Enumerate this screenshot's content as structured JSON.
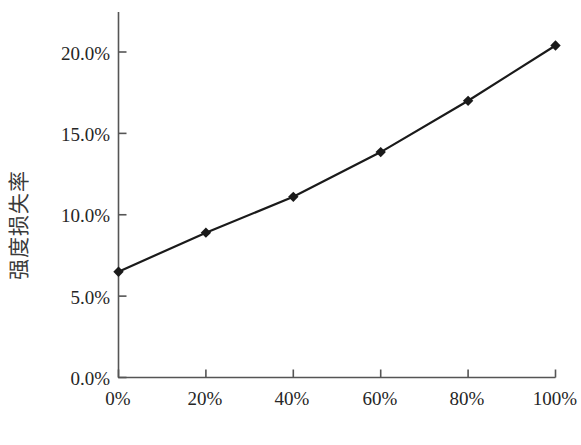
{
  "chart_data": {
    "type": "line",
    "title": "",
    "xlabel": "再生骨料替代率",
    "ylabel": "强度损失率",
    "x": [
      0,
      20,
      40,
      60,
      80,
      100
    ],
    "categories": [
      "0%",
      "20%",
      "40%",
      "60%",
      "80%",
      "100%"
    ],
    "values": [
      6.5,
      8.9,
      11.1,
      13.85,
      17.0,
      20.4
    ],
    "series": [
      {
        "name": "强度损失率",
        "values": [
          6.5,
          8.9,
          11.1,
          13.85,
          17.0,
          20.4
        ]
      }
    ],
    "xlim": [
      0,
      100
    ],
    "ylim": [
      0,
      22
    ],
    "xticks": [
      0,
      20,
      40,
      60,
      80,
      100
    ],
    "xtick_labels": [
      "0%",
      "20%",
      "40%",
      "60%",
      "80%",
      "100%"
    ],
    "yticks": [
      0,
      5,
      10,
      15,
      20
    ],
    "ytick_labels": [
      "0.0%",
      "5.0%",
      "10.0%",
      "15.0%",
      "20.0%"
    ],
    "grid": false,
    "legend": false,
    "legend_position": "none",
    "marker": "diamond",
    "line_color": "#1a1a1a",
    "marker_color": "#1a1a1a",
    "axis_color": "#555555",
    "background_color": "#ffffff"
  }
}
